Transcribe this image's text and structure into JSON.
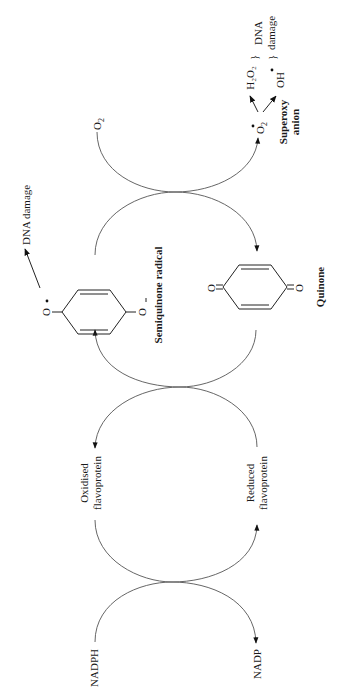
{
  "diagram": {
    "orientation": "rotated -90 degrees (text reads bottom to top)",
    "cycles": [
      {
        "left": "NADPH",
        "right": "NADP"
      },
      {
        "left": "Oxidised flavoprotein",
        "right": "Reduced flavoprotein"
      },
      {
        "left": "Semiquinone radical",
        "right": "Quinone"
      },
      {
        "left": "O2",
        "right": "Superoxy anion"
      }
    ],
    "labels": {
      "nadph": "NADPH",
      "nadp": "NADP",
      "oxidised_1": "Oxidised",
      "oxidised_2": "flavoprotein",
      "reduced_1": "Reduced",
      "reduced_2": "flavoprotein",
      "semiquinone_radical": "Semiquinone radical",
      "quinone": "Quinone",
      "dna_damage_left": "DNA damage",
      "o2": "O",
      "o2_sub": "2",
      "superoxide_sym": "O",
      "superoxide_sub": "2",
      "superoxide_sup": "−",
      "superoxy_1": "Superoxy",
      "superoxy_2": "anion",
      "h2o2": "H₂O₂",
      "oh": "OH",
      "dna_damage_right_1": "DNA",
      "dna_damage_right_2": "damage",
      "semiquinone_o_left": "O",
      "semiquinone_o_right": "O",
      "quinone_o_left": "O",
      "quinone_o_right": "O"
    }
  }
}
